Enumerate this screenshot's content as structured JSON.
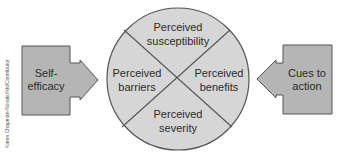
{
  "diagram": {
    "colors": {
      "background": "#ffffff",
      "circle_fill": "#d6d6d6",
      "box_fill": "#b5b5b5",
      "stroke": "#555555",
      "text": "#2a2a2a"
    },
    "center": {
      "quadrants": {
        "top": {
          "line1": "Perceived",
          "line2": "susceptibility"
        },
        "left": {
          "line1": "Perceived",
          "line2": "barriers"
        },
        "right": {
          "line1": "Perceived",
          "line2": "benefits"
        },
        "bottom": {
          "line1": "Perceived",
          "line2": "severity"
        }
      }
    },
    "left_input": {
      "line1": "Self-",
      "line2": "efficacy",
      "arrow_direction": "right"
    },
    "right_input": {
      "line1": "Cues to",
      "line2": "action",
      "arrow_direction": "left"
    },
    "credit": "Karen Chapman-Novakofski/Contributor"
  }
}
